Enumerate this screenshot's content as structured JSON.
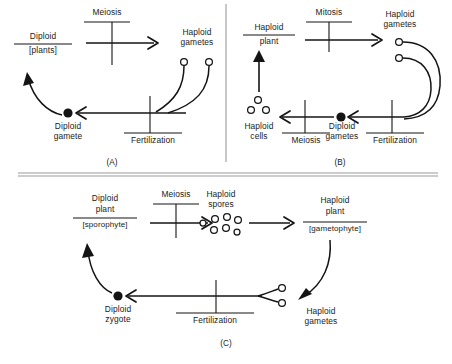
{
  "figure": {
    "background_color": "#ffffff",
    "ink_color": "#141414",
    "divider_color": "#9a9a9a"
  },
  "panels": [
    {
      "id": "A",
      "tag": "(A)",
      "labels": {
        "organism_top": "Diploid",
        "organism_bottom": "[plants]",
        "process_top": "Meiosis",
        "gametes": "Haploid gametes",
        "gametes_line1": "Haploid",
        "gametes_line2": "gametes",
        "zygote_line1": "Diploid",
        "zygote_line2": "gamete",
        "process_bottom": "Fertilization"
      },
      "cells": {
        "haploid_gamete_count": 2,
        "diploid_dot_count": 1
      }
    },
    {
      "id": "B",
      "tag": "(B)",
      "labels": {
        "organism_top": "Haploid",
        "organism_bottom": "plant",
        "process_top": "Mitosis",
        "gametes_line1": "Haploid",
        "gametes_line2": "gametes",
        "haploid_cells_line1": "Haploid",
        "haploid_cells_line2": "cells",
        "process_left": "Meiosis",
        "zygote_line1": "Diploid",
        "zygote_line2": "gametes",
        "process_bottom": "Fertilization"
      },
      "cells": {
        "haploid_gamete_count": 2,
        "haploid_cell_count": 3,
        "diploid_dot_count": 1
      }
    },
    {
      "id": "C",
      "tag": "(C)",
      "labels": {
        "sporophyte_line1": "Diploid",
        "sporophyte_line2": "plant",
        "sporophyte_bracket": "[sporophyte]",
        "process_top": "Meiosis",
        "spores_line1": "Haploid",
        "spores_line2": "spores",
        "gametophyte_line1": "Haploid",
        "gametophyte_line2": "plant",
        "gametophyte_bracket": "[gametophyte]",
        "gametes_line1": "Haploid",
        "gametes_line2": "gametes",
        "zygote_line1": "Diploid",
        "zygote_line2": "zygote",
        "process_bottom": "Fertilization"
      },
      "cells": {
        "spore_count": 7,
        "haploid_gamete_count": 2,
        "diploid_dot_count": 1
      }
    }
  ],
  "caption": {
    "text": ""
  }
}
